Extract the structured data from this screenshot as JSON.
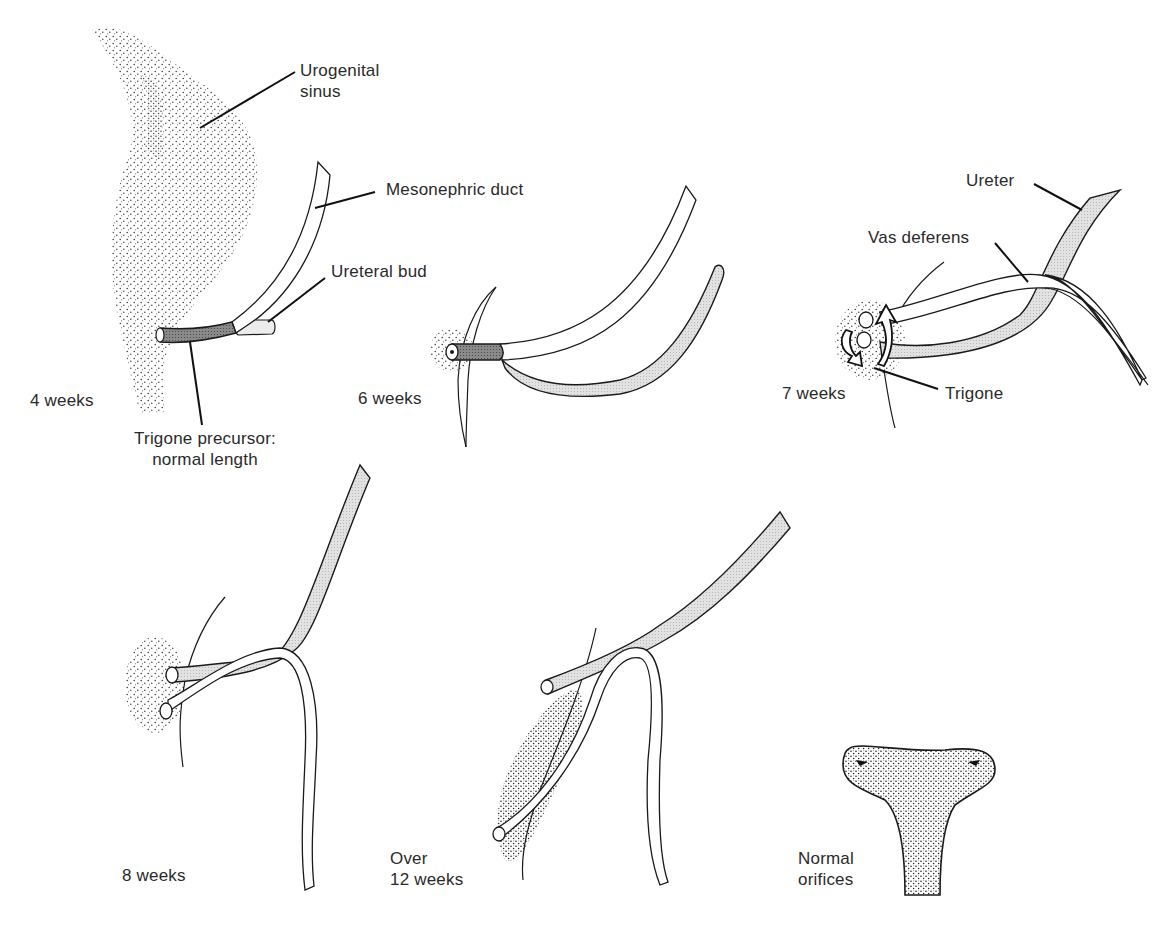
{
  "figure": {
    "type": "embryology-diagram"
  },
  "panels": [
    {
      "id": "4-weeks",
      "stage_label": "4 weeks",
      "annotations": [
        {
          "text_line1": "Urogenital",
          "text_line2": "sinus"
        },
        {
          "text": "Mesonephric duct"
        },
        {
          "text": "Ureteral bud"
        },
        {
          "text_line1": "Trigone precursor:",
          "text_line2": "normal length"
        }
      ]
    },
    {
      "id": "6-weeks",
      "stage_label": "6 weeks"
    },
    {
      "id": "7-weeks",
      "stage_label": "7 weeks",
      "annotations": [
        {
          "text": "Ureter"
        },
        {
          "text": "Vas deferens"
        },
        {
          "text": "Trigone"
        }
      ]
    },
    {
      "id": "8-weeks",
      "stage_label": "8 weeks"
    },
    {
      "id": "over-12-weeks",
      "stage_label_line1": "Over",
      "stage_label_line2": "12 weeks"
    },
    {
      "id": "normal-orifices",
      "label_line1": "Normal",
      "label_line2": "orifices"
    }
  ],
  "colors": {
    "line": "#1a1a1a",
    "ureter_fill": "#d9d9d9",
    "trigone_fill": "#7a7a7a",
    "stipple": "#333333",
    "text": "#2a2a2a",
    "background": "#ffffff"
  }
}
